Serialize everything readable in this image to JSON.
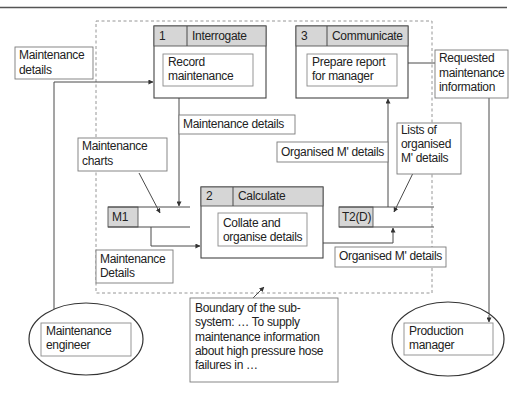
{
  "colors": {
    "line": "#4a4a4a",
    "header_shade": "#d6d6d6",
    "text": "#222222",
    "boundary": "#8a8a8a"
  },
  "processes": [
    {
      "number": "1",
      "name": "Interrogate",
      "task": [
        "Record",
        "maintenance"
      ]
    },
    {
      "number": "2",
      "name": "Calculate",
      "task": [
        "Collate and",
        "organise details"
      ]
    },
    {
      "number": "3",
      "name": "Communicate",
      "task": [
        "Prepare report",
        "for manager"
      ]
    }
  ],
  "stores": [
    {
      "id": "M1"
    },
    {
      "id": "T2(D)"
    }
  ],
  "externals": [
    {
      "name": [
        "Maintenance",
        "engineer"
      ]
    },
    {
      "name": [
        "Production",
        "manager"
      ]
    }
  ],
  "flows": {
    "engineer_to_p1": [
      "Maintenance",
      "details"
    ],
    "p1_to_m1": "Maintenance details",
    "m1_label": [
      "Maintenance",
      "charts"
    ],
    "m1_to_p2": [
      "Maintenance",
      "Details"
    ],
    "t2_to_p3": "Organised M' details",
    "t2_label": [
      "Lists of",
      "organised",
      "M' details"
    ],
    "p2_to_t2": "Organised M' details",
    "p3_to_manager": [
      "Requested",
      "maintenance",
      "information"
    ]
  },
  "boundary_note": [
    "Boundary of the sub-",
    "system: … To supply",
    "maintenance information",
    "about high pressure hose",
    "failures in …"
  ]
}
